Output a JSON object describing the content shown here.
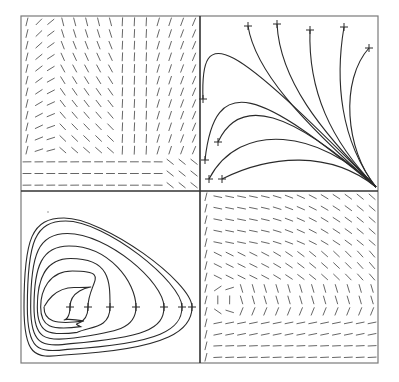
{
  "figure": {
    "frame": {
      "x0": 21,
      "y0": 16,
      "x1": 378,
      "y1": 363,
      "xm": 200,
      "ym": 191
    },
    "colors": {
      "frame": "#7a7a7a",
      "divider": "#333333",
      "field": "#555555",
      "curve": "#2a2a2a",
      "marker": "#2a2a2a",
      "background": "#ffffff"
    }
  },
  "panels": [
    {
      "id": "top-left",
      "kind": "direction-field",
      "label": "Direction field converging to lower-right node",
      "grid": {
        "cols": 15,
        "rows": 15
      }
    },
    {
      "id": "top-right",
      "kind": "trajectories",
      "label": "Trajectories converging to node at lower-right corner",
      "sink": [
        376,
        187
      ],
      "start_markers": [
        [
          248,
          26
        ],
        [
          277,
          24
        ],
        [
          310,
          30
        ],
        [
          344,
          27
        ],
        [
          369,
          48
        ],
        [
          203,
          99
        ],
        [
          205,
          160
        ],
        [
          218,
          142
        ],
        [
          209,
          179
        ],
        [
          222,
          179
        ]
      ]
    },
    {
      "id": "bottom-left",
      "kind": "closed-orbits",
      "label": "Closed orbits around a center",
      "center": [
        68,
        303
      ],
      "markers_y": 307,
      "markers_x": [
        70,
        88,
        110,
        136,
        164,
        182,
        192
      ],
      "dot": [
        48,
        212
      ]
    },
    {
      "id": "bottom-right",
      "kind": "direction-field",
      "label": "Rotational direction field around a center",
      "grid": {
        "cols": 15,
        "rows": 15
      },
      "center": [
        240,
        300
      ]
    }
  ]
}
